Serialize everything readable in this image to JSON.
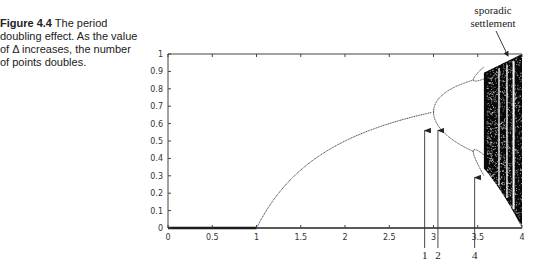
{
  "caption": {
    "label": "Figure 4.4",
    "text": " The period doubling effect. As the value of Δ increases, the number of points doubles."
  },
  "chart_data": {
    "type": "scatter",
    "title": "",
    "xlabel": "",
    "ylabel": "",
    "xlim": [
      0,
      4
    ],
    "ylim": [
      0,
      1
    ],
    "grid": false,
    "x_ticks": [
      "0",
      "0.5",
      "1",
      "1.5",
      "2",
      "2.5",
      "3",
      "3.5",
      "4"
    ],
    "y_ticks": [
      "0",
      "0.1",
      "0.2",
      "0.3",
      "0.4",
      "0.5",
      "0.6",
      "0.7",
      "0.8",
      "0.9",
      "1"
    ],
    "series": [
      {
        "name": "fixed point zero",
        "x": [
          0,
          1
        ],
        "y": [
          0,
          0
        ]
      },
      {
        "name": "fixed point",
        "x": [
          1,
          1.5,
          2,
          2.5,
          3
        ],
        "y": [
          0,
          0.333,
          0.5,
          0.6,
          0.667
        ]
      },
      {
        "name": "period-2 upper",
        "x": [
          3,
          3.2,
          3.449
        ],
        "y": [
          0.667,
          0.799,
          0.852
        ]
      },
      {
        "name": "period-2 lower",
        "x": [
          3,
          3.2,
          3.449
        ],
        "y": [
          0.667,
          0.513,
          0.44
        ]
      }
    ],
    "annotations": [
      {
        "text": "1",
        "x": 2.9,
        "arrow_to_y": 0.56
      },
      {
        "text": "2",
        "x": 3.05,
        "arrow_to_y": 0.56
      },
      {
        "text": "4",
        "x": 3.47,
        "arrow_to_y": 0.29
      },
      {
        "text": "sporadic settlement",
        "x": 3.78,
        "y": 0.97
      }
    ]
  },
  "annotations": {
    "arrow1": "1",
    "arrow2": "2",
    "arrow4": "4",
    "sporadic_line1": "sporadic",
    "sporadic_line2": "settlement"
  },
  "axis": {
    "x_ticks": [
      "0",
      "0.5",
      "1",
      "1.5",
      "2",
      "2.5",
      "3",
      "3.5",
      "4"
    ],
    "y_ticks": [
      "0",
      "0.1",
      "0.2",
      "0.3",
      "0.4",
      "0.5",
      "0.6",
      "0.7",
      "0.8",
      "0.9",
      "1"
    ]
  }
}
